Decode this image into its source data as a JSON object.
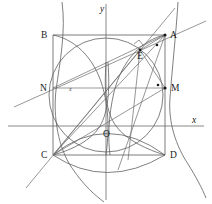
{
  "figure": {
    "axes": {
      "x_label": "x",
      "y_label": "y",
      "x_axis_y": 126,
      "y_axis_x": 106,
      "origin_label": "O"
    },
    "points": [
      {
        "id": "A",
        "label": "A",
        "x": 165,
        "y": 35,
        "label_dx": 5,
        "label_dy": 3,
        "marked": true
      },
      {
        "id": "B",
        "label": "B",
        "x": 53,
        "y": 35,
        "label_dx": -12,
        "label_dy": 3,
        "marked": false
      },
      {
        "id": "C",
        "label": "C",
        "x": 53,
        "y": 155,
        "label_dx": -12,
        "label_dy": 3,
        "marked": false
      },
      {
        "id": "D",
        "label": "D",
        "x": 165,
        "y": 155,
        "label_dx": 5,
        "label_dy": 3,
        "marked": false
      },
      {
        "id": "M",
        "label": "M",
        "x": 165,
        "y": 88,
        "label_dx": 6,
        "label_dy": 3,
        "marked": true
      },
      {
        "id": "N",
        "label": "N",
        "x": 53,
        "y": 88,
        "label_dx": -12,
        "label_dy": 3,
        "marked": false
      },
      {
        "id": "E",
        "label": "E",
        "x": 140,
        "y": 50,
        "label_dx": -3,
        "label_dy": 9,
        "marked": true
      },
      {
        "id": "O",
        "label": "O",
        "x": 106,
        "y": 126,
        "label_dx": -3,
        "label_dy": 11,
        "marked": false
      }
    ],
    "interior_marks": [
      {
        "id": "x-mark-left",
        "label": "x",
        "x": 72,
        "y": 89
      },
      {
        "id": "dot-near-M",
        "label": "",
        "x": 158,
        "y": 85
      },
      {
        "id": "dot-near-A",
        "label": "",
        "x": 157,
        "y": 45
      }
    ],
    "rectangle": {
      "name": "ABDC",
      "left": 53,
      "right": 165,
      "top": 35,
      "bottom": 155
    },
    "circle": {
      "name": "main-circle",
      "cx": 106,
      "cy": 95,
      "r": 57
    },
    "inner_ellipse": {
      "name": "inner-ellipse",
      "cx": 106,
      "cy": 95,
      "rx": 44,
      "ry": 38
    },
    "segments": [
      {
        "name": "seg-C-A",
        "x1": 53,
        "y1": 155,
        "x2": 165,
        "y2": 35
      },
      {
        "name": "seg-C-E",
        "x1": 53,
        "y1": 155,
        "x2": 140,
        "y2": 50
      },
      {
        "name": "seg-C-M",
        "x1": 53,
        "y1": 155,
        "x2": 165,
        "y2": 88
      },
      {
        "name": "seg-A-E",
        "x1": 165,
        "y1": 35,
        "x2": 140,
        "y2": 50
      },
      {
        "name": "seg-E-M",
        "x1": 140,
        "y1": 50,
        "x2": 165,
        "y2": 88
      },
      {
        "name": "seg-N-M",
        "x1": 53,
        "y1": 88,
        "x2": 165,
        "y2": 88
      },
      {
        "name": "seg-N-A",
        "x1": 53,
        "y1": 88,
        "x2": 165,
        "y2": 35
      }
    ],
    "long_lines": [
      {
        "name": "line-through-N-A-extended",
        "x1": 14,
        "y1": 107,
        "x2": 206,
        "y2": 21
      },
      {
        "name": "line-through-C-E-extended",
        "x1": 26,
        "y1": 188,
        "x2": 175,
        "y2": 8
      }
    ],
    "curves": [
      {
        "name": "hyperbola-upper-left-branch"
      },
      {
        "name": "hyperbola-lower-right-branch"
      },
      {
        "name": "parabola-left-arc"
      },
      {
        "name": "parabola-right-arc"
      },
      {
        "name": "arc-top"
      },
      {
        "name": "arc-bottom"
      }
    ],
    "right_angle_marker": {
      "name": "right-angle-at-E",
      "x": 138,
      "y": 42,
      "size": 6
    },
    "colors": {
      "stroke": "#5a5a5a",
      "label": "#1a1a1a",
      "background": "#ffffff"
    }
  }
}
